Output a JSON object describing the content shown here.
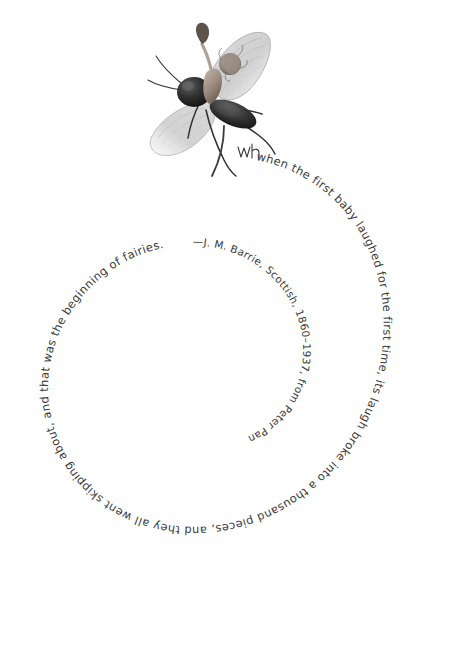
{
  "page": {
    "background_color": "#ffffff",
    "text_color": "#3a3a3a",
    "width": 468,
    "height": 664
  },
  "illustration": {
    "name": "fairy-fly-illustration",
    "description": "grayscale drawing of a fly with a fairy torso and head",
    "signature": "wh"
  },
  "quote": {
    "full_text": "when the first baby laughed for the first time, its laugh broke into a thousand pieces, and they all went skipping about, and that was the beginning of fairies.",
    "segments": [
      "when the first baby laughed for the first time, its laugh broke into a thousand pieces, and they all went skipping about, and that was the beginning of fairies."
    ],
    "layout": "spiral-inward",
    "attribution": {
      "dash": "—",
      "author": "J. M. Barrie",
      "nationality": "Scottish",
      "dates": "1860–1937",
      "source_prefix": "from",
      "source_title": "Peter Pan",
      "full_text": "—J. M. Barrie, Scottish, 1860–1937, from Peter Pan"
    }
  }
}
